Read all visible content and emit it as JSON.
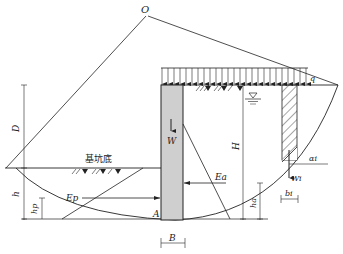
{
  "diagram": {
    "type": "slope-stability-analysis",
    "labels": {
      "center": "O",
      "surcharge": "q",
      "wall_weight": "W",
      "wall_height": "H",
      "embedment_depth": "D",
      "excavation_bottom": "基坑底",
      "passive_force": "Ep",
      "passive_sub": "p",
      "active_force": "Ea",
      "active_sub": "a",
      "toe_point": "A",
      "wall_width": "B",
      "h_label": "h",
      "hp_label": "hp",
      "ha_label": "ha",
      "slice_weight": "Wi",
      "slice_width": "bi",
      "slice_angle": "αi",
      "i_sub": "i"
    },
    "colors": {
      "line": "#222222",
      "wall_fill": "#cfcfcf",
      "background": "#ffffff"
    }
  }
}
